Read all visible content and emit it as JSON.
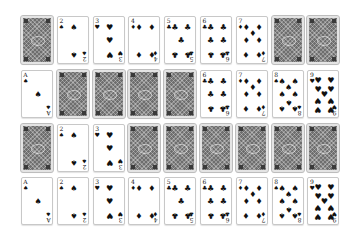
{
  "game": "Card tableau",
  "suit_glyphs": {
    "spades": "♠",
    "hearts": "♥",
    "diamonds": "♦",
    "clubs": "♣"
  },
  "rows": [
    [
      {
        "face": "down"
      },
      {
        "face": "up",
        "rank": "2",
        "suit": "spades"
      },
      {
        "face": "up",
        "rank": "3",
        "suit": "hearts"
      },
      {
        "face": "up",
        "rank": "4",
        "suit": "diamonds"
      },
      {
        "face": "up",
        "rank": "5",
        "suit": "clubs"
      },
      {
        "face": "up",
        "rank": "6",
        "suit": "clubs"
      },
      {
        "face": "up",
        "rank": "7",
        "suit": "diamonds"
      },
      {
        "face": "down"
      },
      {
        "face": "down"
      }
    ],
    [
      {
        "face": "up",
        "rank": "A",
        "suit": "spades"
      },
      {
        "face": "down"
      },
      {
        "face": "down"
      },
      {
        "face": "down"
      },
      {
        "face": "down"
      },
      {
        "face": "up",
        "rank": "6",
        "suit": "clubs"
      },
      {
        "face": "up",
        "rank": "7",
        "suit": "diamonds"
      },
      {
        "face": "up",
        "rank": "8",
        "suit": "spades"
      },
      {
        "face": "up",
        "rank": "9",
        "suit": "hearts"
      }
    ],
    [
      {
        "face": "down"
      },
      {
        "face": "up",
        "rank": "2",
        "suit": "spades"
      },
      {
        "face": "up",
        "rank": "3",
        "suit": "hearts"
      },
      {
        "face": "down"
      },
      {
        "face": "down"
      },
      {
        "face": "down"
      },
      {
        "face": "down"
      },
      {
        "face": "down"
      },
      {
        "face": "down"
      }
    ],
    [
      {
        "face": "up",
        "rank": "A",
        "suit": "spades"
      },
      {
        "face": "up",
        "rank": "2",
        "suit": "spades"
      },
      {
        "face": "up",
        "rank": "3",
        "suit": "hearts"
      },
      {
        "face": "up",
        "rank": "4",
        "suit": "diamonds"
      },
      {
        "face": "up",
        "rank": "5",
        "suit": "clubs"
      },
      {
        "face": "up",
        "rank": "6",
        "suit": "clubs"
      },
      {
        "face": "up",
        "rank": "7",
        "suit": "diamonds"
      },
      {
        "face": "up",
        "rank": "8",
        "suit": "spades"
      },
      {
        "face": "up",
        "rank": "9",
        "suit": "hearts"
      }
    ]
  ]
}
